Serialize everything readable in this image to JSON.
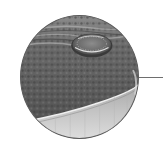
{
  "figure": {
    "colors": {
      "background": "#ffffff",
      "frame_border": "#5a5a5a",
      "surface_dark": "#4a4a4a",
      "surface_mid": "#707070",
      "lower_band": "#c8c8c8",
      "highlight": "#e6e6e6",
      "leader_line": "#6e6e6e"
    }
  }
}
